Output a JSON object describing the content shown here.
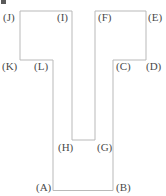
{
  "figure": {
    "name": "labeled-polygon-figure",
    "width": 166,
    "height": 196,
    "background_color": "#ffffff",
    "stroke_color": "#b9b9b9",
    "label_color": "#4a4a4a",
    "stroke_width": 1,
    "outline_path": "M 53 190 L 53 60 L 20 60 L 20 11 L 72 11 L 72 140 L 95 140 L 95 11 L 146 11 L 146 60 L 113 60 L 113 190 Z",
    "vertices": [
      {
        "id": "A",
        "label": "(A)",
        "x": 53,
        "y": 190,
        "label_x": 36,
        "label_y": 182
      },
      {
        "id": "B",
        "label": "(B)",
        "x": 113,
        "y": 190,
        "label_x": 116,
        "label_y": 182
      },
      {
        "id": "C",
        "label": "(C)",
        "x": 113,
        "y": 60,
        "label_x": 116,
        "label_y": 61
      },
      {
        "id": "D",
        "label": "(D)",
        "x": 146,
        "y": 60,
        "label_x": 146,
        "label_y": 61
      },
      {
        "id": "E",
        "label": "(E)",
        "x": 146,
        "y": 11,
        "label_x": 148,
        "label_y": 12
      },
      {
        "id": "F",
        "label": "(F)",
        "x": 95,
        "y": 11,
        "label_x": 98,
        "label_y": 12
      },
      {
        "id": "G",
        "label": "(G)",
        "x": 95,
        "y": 140,
        "label_x": 97,
        "label_y": 142
      },
      {
        "id": "H",
        "label": "(H)",
        "x": 72,
        "y": 140,
        "label_x": 58,
        "label_y": 142
      },
      {
        "id": "I",
        "label": "(I)",
        "x": 72,
        "y": 11,
        "label_x": 57,
        "label_y": 12
      },
      {
        "id": "J",
        "label": "(J)",
        "x": 20,
        "y": 11,
        "label_x": 3,
        "label_y": 12
      },
      {
        "id": "K",
        "label": "(K)",
        "x": 20,
        "y": 60,
        "label_x": 2,
        "label_y": 61
      },
      {
        "id": "L",
        "label": "(L)",
        "x": 53,
        "y": 60,
        "label_x": 34,
        "label_y": 61
      }
    ]
  }
}
